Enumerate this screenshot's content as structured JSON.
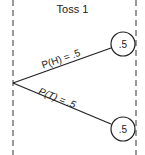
{
  "diagram": {
    "type": "probability-tree",
    "title": "Toss 1",
    "branches": [
      {
        "label": "P(H) = .5",
        "outcome": "H",
        "probability": ".5"
      },
      {
        "label": "P(T) = .5",
        "outcome": "T",
        "probability": ".5"
      }
    ]
  }
}
